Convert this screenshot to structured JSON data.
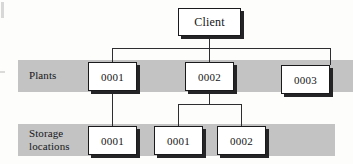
{
  "diagram": {
    "type": "tree",
    "colors": {
      "band": "#c3c3c3",
      "node_fill": "#ffffff",
      "node_border": "#1a1a1c",
      "node_shadow": "#242427",
      "line": "#2e2e30",
      "text": "#141416",
      "background": "#fdfdfc"
    },
    "levels": [
      {
        "id": "level-client",
        "label": "",
        "banded": false
      },
      {
        "id": "level-plants",
        "label": "Plants",
        "banded": true
      },
      {
        "id": "level-storage",
        "label": "Storage\nlocations",
        "banded": true
      }
    ],
    "root": {
      "id": "client",
      "label": "Client"
    },
    "plants": [
      {
        "id": "plant-0001",
        "label": "0001"
      },
      {
        "id": "plant-0002",
        "label": "0002"
      },
      {
        "id": "plant-0003",
        "label": "0003"
      }
    ],
    "storage_locations": [
      {
        "id": "storage-0001-a",
        "label": "0001",
        "parent": "plant-0001"
      },
      {
        "id": "storage-0001-b",
        "label": "0001",
        "parent": "plant-0002"
      },
      {
        "id": "storage-0002",
        "label": "0002",
        "parent": "plant-0002"
      }
    ],
    "edges": [
      {
        "from": "client",
        "to": "plant-0001"
      },
      {
        "from": "client",
        "to": "plant-0002"
      },
      {
        "from": "client",
        "to": "plant-0003"
      },
      {
        "from": "plant-0001",
        "to": "storage-0001-a"
      },
      {
        "from": "plant-0002",
        "to": "storage-0001-b"
      },
      {
        "from": "plant-0002",
        "to": "storage-0002"
      }
    ]
  }
}
